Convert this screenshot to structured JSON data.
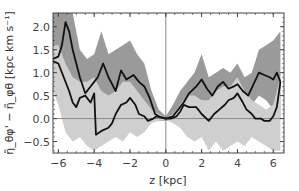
{
  "chart_data": {
    "type": "line",
    "title": "",
    "xlabel": "z [kpc]",
    "ylabel": "η̃_θφ' − η̃_φθ [kpc km s⁻¹]",
    "xlim": [
      -6.3,
      6.6
    ],
    "ylim": [
      -0.75,
      2.3
    ],
    "xticks": [
      -6,
      -4,
      -2,
      0,
      2,
      4,
      6
    ],
    "yticks": [
      -0.5,
      0.0,
      0.5,
      1.0,
      1.5,
      2.0
    ],
    "xtick_labels": [
      "−6",
      "−4",
      "−2",
      "0",
      "2",
      "4",
      "6"
    ],
    "ytick_labels": [
      "−0.5",
      "0.0",
      "0.5",
      "1.0",
      "1.5",
      "2.0"
    ],
    "grid": false,
    "reference_lines": {
      "horizontal_y": 0.0,
      "vertical_x": 0.0
    },
    "series": [
      {
        "name": "curve-upper",
        "x": [
          -6.3,
          -6.0,
          -5.8,
          -5.6,
          -5.4,
          -5.2,
          -5.0,
          -4.8,
          -4.5,
          -4.2,
          -4.0,
          -3.8,
          -3.5,
          -3.2,
          -3.0,
          -2.8,
          -2.5,
          -2.2,
          -1.8,
          -1.5,
          -1.2,
          -0.9,
          -0.6,
          -0.3,
          0.0,
          0.4,
          0.7,
          1.0,
          1.3,
          1.7,
          2.0,
          2.3,
          2.6,
          2.9,
          3.2,
          3.5,
          3.8,
          4.0,
          4.3,
          4.6,
          4.9,
          5.2,
          5.5,
          5.8,
          6.0,
          6.2,
          6.4
        ],
        "values": [
          1.3,
          1.35,
          1.6,
          2.1,
          1.9,
          1.5,
          1.2,
          0.9,
          0.55,
          0.7,
          0.8,
          0.9,
          1.2,
          0.9,
          0.75,
          0.6,
          1.05,
          0.85,
          0.95,
          0.8,
          0.7,
          0.45,
          0.1,
          0.03,
          0.0,
          0.05,
          0.2,
          0.35,
          0.55,
          0.7,
          0.85,
          0.65,
          0.5,
          0.7,
          0.8,
          0.65,
          0.7,
          0.75,
          0.6,
          0.5,
          0.75,
          1.0,
          0.95,
          0.9,
          0.85,
          1.0,
          0.8
        ],
        "color": "#111111"
      },
      {
        "name": "curve-lower",
        "x": [
          -6.3,
          -6.0,
          -5.7,
          -5.4,
          -5.2,
          -5.0,
          -4.8,
          -4.5,
          -4.2,
          -4.0,
          -3.9,
          -3.7,
          -3.5,
          -3.2,
          -3.0,
          -2.8,
          -2.5,
          -2.2,
          -2.0,
          -1.7,
          -1.5,
          -1.2,
          -1.0,
          -0.7,
          -0.5,
          -0.2,
          0.0,
          0.3,
          0.6,
          0.8,
          1.0,
          1.3,
          1.7,
          2.0,
          2.4,
          2.7,
          3.0,
          3.3,
          3.5,
          3.8,
          4.0,
          4.3,
          4.5,
          4.8,
          5.0,
          5.3,
          5.5,
          5.8,
          6.0,
          6.2,
          6.4
        ],
        "values": [
          1.25,
          1.2,
          0.9,
          0.6,
          0.35,
          0.25,
          0.45,
          0.5,
          0.35,
          0.55,
          -0.35,
          -0.3,
          -0.25,
          -0.2,
          -0.1,
          0.1,
          0.3,
          0.35,
          0.45,
          0.3,
          0.1,
          0.05,
          -0.05,
          0.0,
          0.05,
          0.02,
          0.0,
          0.0,
          0.05,
          0.15,
          0.3,
          0.25,
          0.25,
          0.1,
          -0.05,
          0.1,
          0.2,
          0.3,
          0.4,
          0.45,
          0.55,
          0.35,
          0.2,
          0.1,
          0.0,
          0.0,
          -0.05,
          -0.05,
          0.05,
          0.25,
          0.8
        ],
        "color": "#111111"
      }
    ],
    "bands": [
      {
        "name": "band-dark",
        "color": "#9a9a9a",
        "x": [
          -6.3,
          -6.0,
          -5.6,
          -5.2,
          -4.8,
          -4.4,
          -4.0,
          -3.6,
          -3.2,
          -2.8,
          -2.4,
          -2.0,
          -1.6,
          -1.2,
          -0.8,
          -0.4,
          0.0,
          0.4,
          0.8,
          1.2,
          1.6,
          2.0,
          2.4,
          2.8,
          3.2,
          3.6,
          4.0,
          4.4,
          4.8,
          5.2,
          5.6,
          6.0,
          6.4
        ],
        "upper": [
          2.3,
          2.3,
          2.3,
          2.3,
          1.5,
          1.3,
          1.4,
          1.9,
          1.4,
          1.5,
          1.6,
          1.7,
          1.4,
          1.2,
          0.6,
          0.2,
          0.05,
          0.3,
          0.6,
          0.8,
          1.0,
          1.4,
          0.9,
          1.0,
          1.1,
          1.0,
          1.2,
          0.9,
          1.0,
          1.5,
          1.6,
          1.7,
          1.9
        ],
        "lower": [
          0.6,
          0.6,
          0.9,
          0.6,
          0.3,
          0.2,
          0.3,
          0.4,
          0.2,
          0.3,
          0.4,
          0.4,
          0.3,
          0.3,
          0.0,
          -0.05,
          -0.05,
          -0.05,
          0.1,
          0.2,
          0.3,
          0.4,
          0.2,
          0.3,
          0.4,
          0.3,
          0.4,
          0.2,
          0.3,
          0.5,
          0.4,
          0.2,
          0.0
        ]
      },
      {
        "name": "band-light",
        "color": "#cfcfcf",
        "x": [
          -6.3,
          -6.0,
          -5.6,
          -5.2,
          -4.8,
          -4.4,
          -4.0,
          -3.6,
          -3.2,
          -2.8,
          -2.4,
          -2.0,
          -1.6,
          -1.2,
          -0.8,
          -0.4,
          0.0,
          0.4,
          0.8,
          1.2,
          1.6,
          2.0,
          2.4,
          2.8,
          3.2,
          3.6,
          4.0,
          4.4,
          4.8,
          5.2,
          5.6,
          6.0,
          6.4
        ],
        "upper": [
          1.6,
          1.6,
          1.2,
          0.9,
          0.8,
          0.8,
          0.9,
          0.6,
          0.5,
          0.6,
          0.8,
          0.8,
          0.6,
          0.4,
          0.2,
          0.1,
          0.02,
          0.1,
          0.3,
          0.5,
          0.5,
          0.4,
          0.4,
          0.6,
          0.7,
          0.7,
          0.9,
          0.6,
          0.4,
          0.3,
          0.2,
          0.3,
          0.9
        ],
        "lower": [
          0.6,
          0.3,
          -0.3,
          -0.5,
          -0.4,
          -0.6,
          -0.7,
          -0.6,
          -0.5,
          -0.4,
          -0.5,
          -0.3,
          -0.4,
          -0.3,
          -0.1,
          -0.05,
          -0.02,
          -0.1,
          -0.2,
          -0.4,
          -0.5,
          -0.4,
          -0.7,
          -0.5,
          -0.7,
          -0.6,
          -0.5,
          -0.6,
          -0.4,
          -0.5,
          -0.6,
          -0.7,
          -0.7
        ]
      }
    ]
  }
}
